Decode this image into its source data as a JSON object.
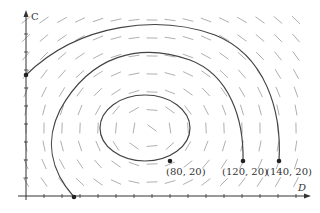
{
  "axes": {
    "x_label": "D",
    "y_label": "C"
  },
  "direction_field": {
    "description": "slope field of a predator-prey style system with closed orbits about an equilibrium",
    "color": "#999999"
  },
  "trajectories": [
    {
      "name": "inner-orbit",
      "start_label": "(80, 20)",
      "shape": "closed"
    },
    {
      "name": "middle-orbit",
      "start_label": "(120, 20)",
      "shape": "open-to-axis"
    },
    {
      "name": "outer-orbit",
      "start_label": "(140, 20)",
      "shape": "open-to-axis"
    }
  ],
  "point_labels": [
    "(80, 20)",
    "(120, 20)",
    "(140, 20)"
  ],
  "colors": {
    "curve": "#444444",
    "axis": "#333333",
    "field": "#9a9a9a"
  }
}
